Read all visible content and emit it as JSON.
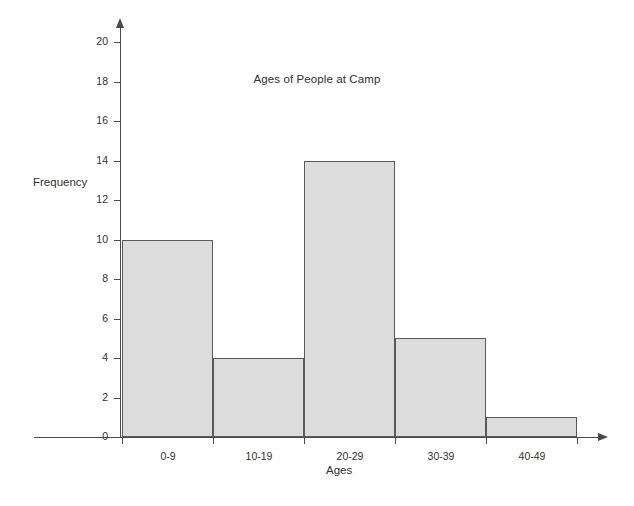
{
  "chart_data": {
    "type": "bar",
    "title": "Ages of People at Camp",
    "xlabel": "Ages",
    "ylabel": "Frequency",
    "categories": [
      "0-9",
      "10-19",
      "20-29",
      "30-39",
      "40-49"
    ],
    "values": [
      10,
      4,
      14,
      5,
      1
    ],
    "ylim": [
      0,
      20
    ],
    "ytick_step": 2,
    "yticks": [
      0,
      2,
      4,
      6,
      8,
      10,
      12,
      14,
      16,
      18,
      20
    ],
    "ytick_labels": [
      "0",
      "2",
      "4",
      "6",
      "8",
      "10",
      "12",
      "14",
      "16",
      "18",
      "20"
    ],
    "grid": false,
    "legend": false,
    "legend_position": "none",
    "series": [
      {
        "name": "Frequency",
        "values": [
          10,
          4,
          14,
          5,
          1
        ]
      }
    ],
    "bar_fill_color": "#dcdcdc",
    "bar_border_color": "#5a5a5a",
    "axis_color": "#4a4a4a",
    "text_color": "#303030",
    "background_color": "#ffffff"
  }
}
